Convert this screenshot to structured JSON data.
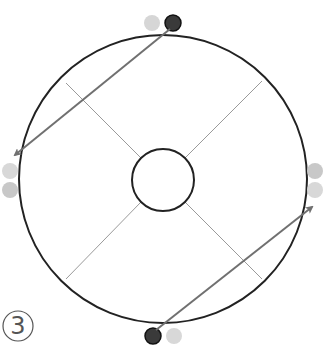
{
  "diagram": {
    "label": "3",
    "colors": {
      "outline": "#222222",
      "spoke": "#999999",
      "arrow": "#707070",
      "dot_dark": "#3a3a3a",
      "dot_light": "#d4d4d4"
    },
    "outer_circle": {
      "cx": 163,
      "cy": 179,
      "r": 144
    },
    "inner_circle": {
      "cx": 163,
      "cy": 180,
      "r": 31
    },
    "markers": [
      {
        "position": "top",
        "dots": [
          "light",
          "dark"
        ]
      },
      {
        "position": "left",
        "dots": [
          "light",
          "light"
        ]
      },
      {
        "position": "right",
        "dots": [
          "light",
          "light"
        ]
      },
      {
        "position": "bottom",
        "dots": [
          "dark",
          "light"
        ]
      }
    ],
    "arrows": [
      {
        "from": "top-dark-dot",
        "to": "left-side"
      },
      {
        "from": "bottom-dark-dot",
        "to": "right-side"
      }
    ]
  }
}
